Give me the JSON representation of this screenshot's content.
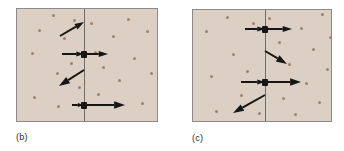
{
  "figure": {
    "background": "#ffffff",
    "panel_fill": "#dccfc3",
    "panel_border": "#8a8a8a",
    "dot_color": "#a2836c",
    "particle_color": "#161616",
    "arrow_color": "#161616",
    "divider_color": "#6f6b66"
  },
  "panels": [
    {
      "id": "b",
      "label": "(b)",
      "box": {
        "x": 16,
        "y": 8,
        "w": 142,
        "h": 114
      },
      "label_pos": {
        "x": 16,
        "y": 132
      },
      "divider_x": 84,
      "dots": [
        [
          31,
          52
        ],
        [
          33,
          96
        ],
        [
          38,
          29
        ],
        [
          52,
          14
        ],
        [
          56,
          72
        ],
        [
          57,
          105
        ],
        [
          63,
          37
        ],
        [
          70,
          62
        ],
        [
          73,
          19
        ],
        [
          78,
          86
        ],
        [
          90,
          22
        ],
        [
          94,
          51
        ],
        [
          97,
          93
        ],
        [
          102,
          66
        ],
        [
          112,
          35
        ],
        [
          118,
          79
        ],
        [
          127,
          18
        ],
        [
          133,
          57
        ],
        [
          141,
          102
        ],
        [
          146,
          30
        ],
        [
          150,
          72
        ]
      ],
      "particles": [
        {
          "x": 84,
          "y": 54
        },
        {
          "x": 84,
          "y": 105
        }
      ],
      "vectors": [
        {
          "name": "free-particle-velocity-upper",
          "x1": 60,
          "y1": 36,
          "x2": 84,
          "y2": 22,
          "head": 6
        },
        {
          "name": "incident-velocity-middle",
          "x1": 62,
          "y1": 54,
          "x2": 84,
          "y2": 54,
          "head": 5
        },
        {
          "name": "outgoing-velocity-middle",
          "x1": 86,
          "y1": 54,
          "x2": 108,
          "y2": 54,
          "head": 6
        },
        {
          "name": "free-particle-velocity-lower",
          "x1": 84,
          "y1": 70,
          "x2": 59,
          "y2": 86,
          "head": 7
        },
        {
          "name": "incident-velocity-bottom",
          "x1": 72,
          "y1": 105,
          "x2": 84,
          "y2": 105,
          "head": 4
        },
        {
          "name": "outgoing-velocity-bottom",
          "x1": 86,
          "y1": 105,
          "x2": 125,
          "y2": 105,
          "head": 7
        }
      ]
    },
    {
      "id": "c",
      "label": "(c)",
      "box": {
        "x": 192,
        "y": 9,
        "w": 140,
        "h": 113
      },
      "label_pos": {
        "x": 192,
        "y": 133
      },
      "divider_x": 265,
      "dots": [
        [
          205,
          30
        ],
        [
          210,
          75
        ],
        [
          215,
          110
        ],
        [
          226,
          16
        ],
        [
          232,
          53
        ],
        [
          240,
          94
        ],
        [
          246,
          70
        ],
        [
          252,
          22
        ],
        [
          258,
          112
        ],
        [
          268,
          17
        ],
        [
          278,
          41
        ],
        [
          282,
          97
        ],
        [
          288,
          63
        ],
        [
          294,
          113
        ],
        [
          300,
          27
        ],
        [
          305,
          82
        ],
        [
          312,
          48
        ],
        [
          318,
          101
        ],
        [
          321,
          13
        ],
        [
          326,
          68
        ],
        [
          329,
          36
        ]
      ],
      "particles": [
        {
          "x": 265,
          "y": 29
        },
        {
          "x": 265,
          "y": 82
        }
      ],
      "vectors": [
        {
          "name": "incident-velocity-top",
          "x1": 245,
          "y1": 29,
          "x2": 265,
          "y2": 29,
          "head": 5
        },
        {
          "name": "outgoing-velocity-top",
          "x1": 267,
          "y1": 29,
          "x2": 292,
          "y2": 29,
          "head": 6
        },
        {
          "name": "free-particle-velocity-upper",
          "x1": 265,
          "y1": 51,
          "x2": 287,
          "y2": 64,
          "head": 7
        },
        {
          "name": "incident-velocity-middle",
          "x1": 241,
          "y1": 82,
          "x2": 265,
          "y2": 82,
          "head": 5
        },
        {
          "name": "outgoing-velocity-middle",
          "x1": 267,
          "y1": 82,
          "x2": 301,
          "y2": 82,
          "head": 7
        },
        {
          "name": "free-particle-velocity-lower",
          "x1": 265,
          "y1": 95,
          "x2": 233,
          "y2": 113,
          "head": 7
        }
      ]
    }
  ]
}
